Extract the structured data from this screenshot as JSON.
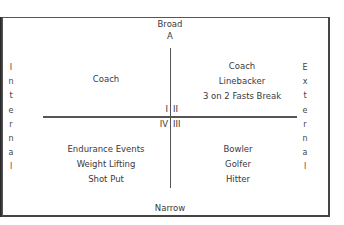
{
  "axes": {
    "top": "Broad",
    "top_letter": "A",
    "bottom": "Narrow",
    "left": "Internal",
    "right": "External"
  },
  "left_letters": [
    "I",
    "n",
    "t",
    "e",
    "r",
    "n",
    "a",
    "l"
  ],
  "right_letters": [
    "E",
    "x",
    "t",
    "e",
    "r",
    "n",
    "a",
    "l"
  ],
  "quadrant_labels": {
    "q1": "I",
    "q2": "II",
    "q3": "III",
    "q4": "IV"
  },
  "quadrants": {
    "top_left": [
      "Coach"
    ],
    "top_right": [
      "Coach",
      "Linebacker",
      "3 on 2 Fasts Break"
    ],
    "bottom_left": [
      "Endurance Events",
      "Weight Lifting",
      "Shot Put"
    ],
    "bottom_right": [
      "Bowler",
      "Golfer",
      "Hitter"
    ]
  }
}
